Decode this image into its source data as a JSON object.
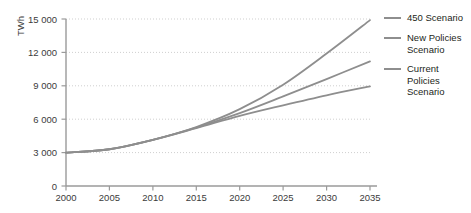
{
  "chart_data": {
    "type": "line",
    "title": "",
    "xlabel": "",
    "ylabel": "TWh",
    "xlim": [
      2000,
      2035
    ],
    "ylim": [
      0,
      15000
    ],
    "grid": true,
    "legend_position": "right",
    "x_ticks": [
      "2000",
      "2005",
      "2010",
      "2015",
      "2020",
      "2025",
      "2030",
      "2035"
    ],
    "y_ticks": [
      "0",
      "3 000",
      "6 000",
      "9 000",
      "12 000",
      "15 000"
    ],
    "x": [
      2000,
      2005,
      2010,
      2015,
      2020,
      2025,
      2030,
      2035
    ],
    "series": [
      {
        "name": "450 Scenario",
        "color": "#8e8e8e",
        "values": [
          3000,
          3300,
          4150,
          5300,
          6900,
          9100,
          11900,
          14900
        ]
      },
      {
        "name": "New Policies Scenario",
        "color": "#8e8e8e",
        "values": [
          3000,
          3300,
          4150,
          5250,
          6550,
          8050,
          9600,
          11200
        ]
      },
      {
        "name": "Current Policies Scenario",
        "color": "#8e8e8e",
        "values": [
          3000,
          3300,
          4150,
          5200,
          6300,
          7250,
          8150,
          8950
        ]
      }
    ]
  },
  "legend": {
    "entries": [
      {
        "label": "450 Scenario",
        "color": "#8e8e8e"
      },
      {
        "label": "New Policies\nScenario",
        "color": "#8e8e8e"
      },
      {
        "label": "Current Policies\nScenario",
        "color": "#8e8e8e"
      }
    ]
  },
  "axes": {
    "y_axis_title": "TWh"
  },
  "colors": {
    "axis": "#9a9a9a",
    "gridline": "#cfcfcf",
    "line": "#8e8e8e",
    "text": "#231f20"
  }
}
